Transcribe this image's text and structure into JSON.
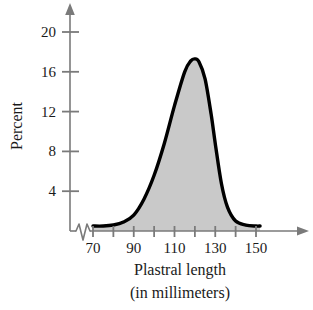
{
  "chart_data": {
    "type": "area",
    "title": "",
    "subtitle": "",
    "xlabel": "Plastral length",
    "xlabel_line2": "(in millimeters)",
    "ylabel": "Percent",
    "xlim": [
      70,
      152
    ],
    "ylim": [
      0,
      22
    ],
    "x_ticks": [
      70,
      80,
      90,
      100,
      110,
      120,
      130,
      140,
      150
    ],
    "x_tick_labels": [
      "70",
      "",
      "90",
      "",
      "110",
      "",
      "130",
      "",
      "150"
    ],
    "y_ticks": [
      4,
      8,
      12,
      16,
      20
    ],
    "y_tick_labels": [
      "4",
      "8",
      "12",
      "16",
      "20"
    ],
    "grid": false,
    "legend": "none",
    "axis_break": true,
    "axis_break_note": "zigzag break on horizontal axis between origin and 70",
    "fill_color": "#c9c9c9",
    "line_color": "#000000",
    "axis_color": "#7a7a7a",
    "x": [
      70,
      75,
      80,
      85,
      90,
      95,
      100,
      105,
      110,
      115,
      118,
      120,
      122,
      125,
      128,
      130,
      133,
      136,
      140,
      145,
      150,
      152
    ],
    "values": [
      0.5,
      0.5,
      0.6,
      0.9,
      1.6,
      3.2,
      5.6,
      8.8,
      12.6,
      16.0,
      17.1,
      17.3,
      17.0,
      15.3,
      11.7,
      8.8,
      4.8,
      2.4,
      1.0,
      0.6,
      0.5,
      0.5
    ],
    "peak": {
      "x": 120,
      "y": 17.3
    },
    "series": [
      {
        "name": "Plastral length distribution",
        "values": [
          0.5,
          0.5,
          0.6,
          0.9,
          1.6,
          3.2,
          5.6,
          8.8,
          12.6,
          16.0,
          17.1,
          17.3,
          17.0,
          15.3,
          11.7,
          8.8,
          4.8,
          2.4,
          1.0,
          0.6,
          0.5,
          0.5
        ]
      }
    ]
  },
  "axes": {
    "y_label": "Percent",
    "x_label_line1": "Plastral length",
    "x_label_line2": "(in millimeters)"
  },
  "ticks": {
    "y": [
      "20",
      "16",
      "12",
      "8",
      "4"
    ],
    "x": [
      "70",
      "90",
      "110",
      "130",
      "150"
    ]
  }
}
